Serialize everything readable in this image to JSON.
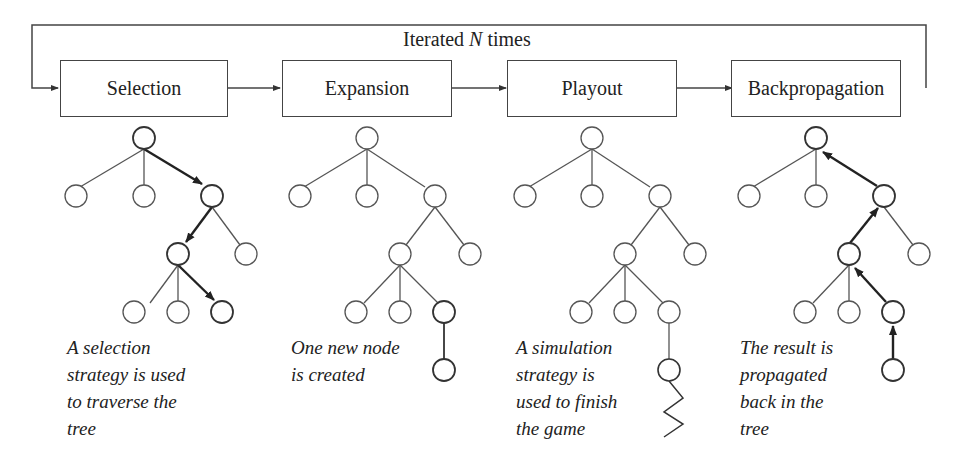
{
  "loop": {
    "label_prefix": "Iterated",
    "label_var": "N",
    "label_suffix": "times"
  },
  "steps": [
    {
      "label": "Selection",
      "caption": "A selection\nstrategy is used\nto traverse the\ntree"
    },
    {
      "label": "Expansion",
      "caption": "One new node\nis created"
    },
    {
      "label": "Playout",
      "caption": "A simulation\nstrategy is\nused to finish\nthe game"
    },
    {
      "label": "Backpropagation",
      "caption": "The result is\npropagated\nback in the\ntree"
    }
  ],
  "colors": {
    "line": "#444444",
    "bold_line": "#222222",
    "background": "#ffffff"
  }
}
